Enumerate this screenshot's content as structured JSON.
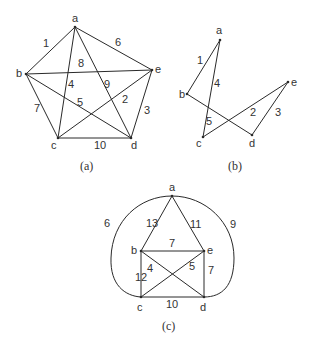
{
  "figures": [
    {
      "id": "a",
      "caption": "(a)",
      "caption_pos": [
        89,
        170
      ],
      "vertices": [
        {
          "name": "a",
          "x": 75,
          "y": 27,
          "lx": 72,
          "ly": 22
        },
        {
          "name": "b",
          "x": 26,
          "y": 74,
          "lx": 16,
          "ly": 77
        },
        {
          "name": "c",
          "x": 58,
          "y": 138,
          "lx": 51,
          "ly": 149
        },
        {
          "name": "d",
          "x": 131,
          "y": 138,
          "lx": 131,
          "ly": 149
        },
        {
          "name": "e",
          "x": 152,
          "y": 70,
          "lx": 155,
          "ly": 73
        }
      ],
      "edges": [
        {
          "from": "a",
          "to": "b",
          "weight": "1",
          "lx": 43,
          "ly": 47
        },
        {
          "from": "a",
          "to": "e",
          "weight": "6",
          "lx": 115,
          "ly": 46
        },
        {
          "from": "b",
          "to": "e",
          "weight": "8",
          "lx": 78,
          "ly": 67
        },
        {
          "from": "a",
          "to": "c",
          "weight": "4",
          "lx": 68,
          "ly": 88
        },
        {
          "from": "a",
          "to": "d",
          "weight": "9",
          "lx": 104,
          "ly": 88
        },
        {
          "from": "b",
          "to": "d",
          "weight": "5",
          "lx": 77,
          "ly": 106
        },
        {
          "from": "c",
          "to": "e",
          "weight": "2",
          "lx": 122,
          "ly": 103
        },
        {
          "from": "e",
          "to": "d",
          "weight": "3",
          "lx": 144,
          "ly": 114
        },
        {
          "from": "b",
          "to": "c",
          "weight": "7",
          "lx": 34,
          "ly": 112
        },
        {
          "from": "c",
          "to": "d",
          "weight": "10",
          "lx": 94,
          "ly": 149
        }
      ]
    },
    {
      "id": "b",
      "caption": "(b)",
      "caption_pos": [
        237,
        170
      ],
      "vertices": [
        {
          "name": "a",
          "x": 220,
          "y": 40,
          "lx": 216,
          "ly": 34
        },
        {
          "name": "b",
          "x": 187,
          "y": 94,
          "lx": 179,
          "ly": 98
        },
        {
          "name": "c",
          "x": 203,
          "y": 137,
          "lx": 196,
          "ly": 147
        },
        {
          "name": "d",
          "x": 252,
          "y": 135,
          "lx": 249,
          "ly": 147
        },
        {
          "name": "e",
          "x": 288,
          "y": 82,
          "lx": 291,
          "ly": 86
        }
      ],
      "edges": [
        {
          "from": "a",
          "to": "b",
          "weight": "1",
          "lx": 197,
          "ly": 64
        },
        {
          "from": "a",
          "to": "c",
          "weight": "4",
          "lx": 214,
          "ly": 87
        },
        {
          "from": "b",
          "to": "d",
          "weight": "5",
          "lx": 206,
          "ly": 125
        },
        {
          "from": "c",
          "to": "e",
          "weight": "2",
          "lx": 250,
          "ly": 116
        },
        {
          "from": "e",
          "to": "d",
          "weight": "3",
          "lx": 275,
          "ly": 116
        }
      ]
    },
    {
      "id": "c",
      "caption": "(c)",
      "caption_pos": [
        171,
        330
      ],
      "vertices": [
        {
          "name": "a",
          "x": 172,
          "y": 196,
          "lx": 169,
          "ly": 191
        },
        {
          "name": "b",
          "x": 141,
          "y": 251,
          "lx": 131,
          "ly": 254
        },
        {
          "name": "c",
          "x": 141,
          "y": 297,
          "lx": 137,
          "ly": 311
        },
        {
          "name": "d",
          "x": 204,
          "y": 297,
          "lx": 200,
          "ly": 311
        },
        {
          "name": "e",
          "x": 204,
          "y": 251,
          "lx": 207,
          "ly": 254
        }
      ],
      "edges": [
        {
          "from": "a",
          "to": "b",
          "weight": "13",
          "lx": 146,
          "ly": 227
        },
        {
          "from": "a",
          "to": "e",
          "weight": "11",
          "lx": 190,
          "ly": 228
        },
        {
          "from": "b",
          "to": "e",
          "weight": "7",
          "lx": 169,
          "ly": 247
        },
        {
          "from": "b",
          "to": "d",
          "weight": "4",
          "lx": 147,
          "ly": 272
        },
        {
          "from": "c",
          "to": "e",
          "weight": "5",
          "lx": 189,
          "ly": 270
        },
        {
          "from": "b",
          "to": "c",
          "weight": "12",
          "lx": 135,
          "ly": 281
        },
        {
          "from": "e",
          "to": "d",
          "weight": "7",
          "lx": 208,
          "ly": 274
        },
        {
          "from": "c",
          "to": "d",
          "weight": "10",
          "lx": 166,
          "ly": 308
        },
        {
          "from": "a",
          "to": "c",
          "weight": "6",
          "curved": true,
          "side": "left",
          "lx": 104,
          "ly": 227
        },
        {
          "from": "a",
          "to": "d",
          "weight": "9",
          "curved": true,
          "side": "right",
          "lx": 230,
          "ly": 228
        }
      ]
    }
  ]
}
